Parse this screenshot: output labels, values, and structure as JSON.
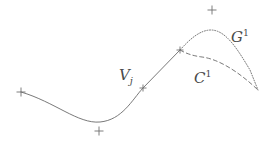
{
  "figure": {
    "background_color": "#ffffff",
    "width": 270,
    "height": 143
  },
  "labels": {
    "g1": {
      "base": "G",
      "superscript": "1",
      "x": 231,
      "y": 28
    },
    "c1": {
      "base": "C",
      "superscript": "1",
      "x": 194,
      "y": 69
    },
    "vj": {
      "base": "V",
      "subscript": "j",
      "x": 119,
      "y": 68
    }
  },
  "styles": {
    "line_color": "#6a6a6a",
    "marker_color": "#6f6f6f",
    "text_color": "#4a4a4a",
    "solid_width": 0.9,
    "dotted_width": 0.9,
    "dashed_width": 0.9,
    "dotted_dash_array": "1,1.6",
    "dashed_dash_array": "4,3"
  },
  "curves": [
    {
      "name": "base-solid-curve",
      "style": "solid",
      "path": "M 21 92 C 55 102, 78 124, 100 122 C 122 120, 132 100, 143 88 L 180 50"
    },
    {
      "name": "g1-dotted-curve",
      "style": "dotted",
      "path": "M 180 50 C 190 39, 200 30, 211 30 C 226 30, 238 50, 250 70 L 258 90"
    },
    {
      "name": "c1-dashed-curve",
      "style": "dashed",
      "path": "M 180 50 C 187 54, 194 56, 202 57 C 218 59, 238 71, 258 90"
    }
  ],
  "markers": [
    {
      "name": "control-point-left",
      "x": 21,
      "y": 92,
      "size": 4.5
    },
    {
      "name": "control-point-bottom",
      "x": 99,
      "y": 131,
      "size": 4.5
    },
    {
      "name": "control-point-vj",
      "x": 143,
      "y": 88,
      "size": 3.5
    },
    {
      "name": "control-point-middle",
      "x": 180,
      "y": 50,
      "size": 3.5
    },
    {
      "name": "control-point-top",
      "x": 212,
      "y": 10,
      "size": 4.5
    }
  ]
}
